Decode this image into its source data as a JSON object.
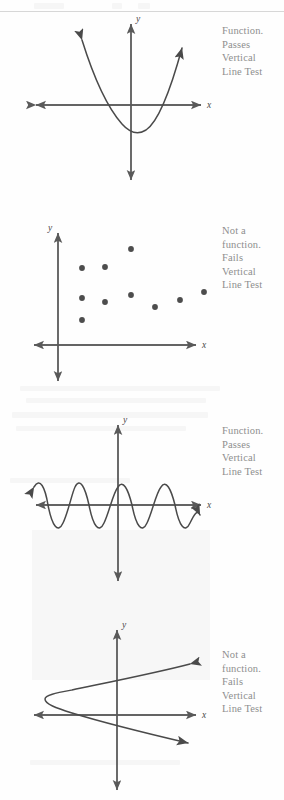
{
  "page": {
    "width": 284,
    "height": 800,
    "background": "#fefefe",
    "ink_color": "#4a4a4a",
    "axis_color": "#5a5a5a",
    "caption_color": "#8e8e8e"
  },
  "captions": {
    "function_passes": "Function.\nPasses\nVertical\nLine Test",
    "not_a_function_fails": "Not a\nfunction.\nFails\nVertical\nLine Test"
  },
  "axis_labels": {
    "x": "x",
    "y": "y"
  },
  "panels": [
    {
      "id": "panel-parabola-up",
      "index": 1,
      "graph_name": "upward-parabola",
      "caption": "Function.\nPasses\nVertical\nLine Test",
      "verdict": "Function. Passes Vertical Line Test",
      "x_axis_y": 105,
      "y_axis_x": 131,
      "caption_x": 222,
      "caption_y": 24
    },
    {
      "id": "panel-scatter",
      "index": 2,
      "graph_name": "scatter-points",
      "caption": "Not a\nfunction.\nFails\nVertical\nLine Test",
      "verdict": "Not a function. Fails Vertical Line Test",
      "x_axis_y": 345,
      "y_axis_x": 58,
      "caption_x": 222,
      "caption_y": 224
    },
    {
      "id": "panel-sine",
      "index": 3,
      "graph_name": "sine-wave",
      "caption": "Function.\nPasses\nVertical\nLine Test",
      "verdict": "Function. Passes Vertical Line Test",
      "x_axis_y": 505,
      "y_axis_x": 118,
      "caption_x": 222,
      "caption_y": 424
    },
    {
      "id": "panel-parabola-right",
      "index": 4,
      "graph_name": "rightward-parabola",
      "caption": "Not a\nfunction.\nFails\nVertical\nLine Test",
      "verdict": "Not a function. Fails Vertical Line Test",
      "x_axis_y": 715,
      "y_axis_x": 117,
      "caption_x": 222,
      "caption_y": 648
    }
  ],
  "chart_data": [
    {
      "type": "line",
      "id": "upward-parabola",
      "title": "Function. Passes Vertical Line Test",
      "xlabel": "x",
      "ylabel": "y",
      "grid": false,
      "legend": "none",
      "curve": "parabola opening upward, vertex below x-axis left of origin, both branches end in arrowheads",
      "vertex": [
        -5,
        -42
      ],
      "x_axis": {
        "from": [
          30,
          105
        ],
        "to": [
          207,
          105
        ],
        "arrows": "both"
      },
      "y_axis": {
        "from": [
          131,
          18
        ],
        "to": [
          131,
          185
        ],
        "arrows": "both"
      },
      "points": [
        [
          79,
          37
        ],
        [
          88,
          55
        ],
        [
          98,
          75
        ],
        [
          110,
          94
        ],
        [
          118,
          104
        ],
        [
          126,
          114
        ],
        [
          134,
          124
        ],
        [
          142,
          131
        ],
        [
          150,
          126
        ],
        [
          158,
          113
        ],
        [
          166,
          95
        ],
        [
          175,
          70
        ],
        [
          184,
          44
        ],
        [
          190,
          35
        ]
      ]
    },
    {
      "type": "scatter",
      "id": "scatter-points",
      "title": "Not a function. Fails Vertical Line Test",
      "xlabel": "x",
      "ylabel": "y",
      "grid": false,
      "legend": "none",
      "note": "Two points share the same x value, so a vertical line meets the graph twice",
      "x_axis": {
        "from": [
          28,
          345
        ],
        "to": [
          200,
          345
        ],
        "arrows": "both"
      },
      "y_axis": {
        "from": [
          58,
          228
        ],
        "to": [
          58,
          382
        ],
        "arrows": "both"
      },
      "x": [
        82,
        82,
        82,
        105,
        105,
        131,
        131,
        155,
        180,
        204
      ],
      "y": [
        298,
        268,
        320,
        267,
        302,
        249,
        295,
        307,
        300,
        292
      ],
      "values": [
        {
          "x": 82,
          "y": 298
        },
        {
          "x": 82,
          "y": 268
        },
        {
          "x": 82,
          "y": 320
        },
        {
          "x": 105,
          "y": 267
        },
        {
          "x": 105,
          "y": 302
        },
        {
          "x": 131,
          "y": 249
        },
        {
          "x": 131,
          "y": 295
        },
        {
          "x": 155,
          "y": 307
        },
        {
          "x": 180,
          "y": 300
        },
        {
          "x": 204,
          "y": 292
        }
      ]
    },
    {
      "type": "line",
      "id": "sine-wave",
      "title": "Function. Passes Vertical Line Test",
      "xlabel": "x",
      "ylabel": "y",
      "grid": false,
      "legend": "none",
      "curve": "sinusoid, approximately three full cycles, amplitude ~18 px, period ~58 px",
      "amplitude": 18,
      "period": 58,
      "cycles": 3,
      "x_axis": {
        "from": [
          30,
          505
        ],
        "to": [
          207,
          505
        ],
        "arrows": "both"
      },
      "y_axis": {
        "from": [
          118,
          420
        ],
        "to": [
          118,
          580
        ],
        "arrows": "both"
      }
    },
    {
      "type": "line",
      "id": "rightward-parabola",
      "title": "Not a function. Fails Vertical Line Test",
      "xlabel": "x",
      "ylabel": "y",
      "grid": false,
      "legend": "none",
      "curve": "parabola opening to the right, vertex left of the y-axis, both branches end in arrowheads",
      "vertex": [
        45,
        697
      ],
      "x_axis": {
        "from": [
          28,
          715
        ],
        "to": [
          200,
          715
        ],
        "arrows": "both"
      },
      "y_axis": {
        "from": [
          117,
          628
        ],
        "to": [
          117,
          790
        ],
        "arrows": "both"
      }
    }
  ],
  "artifacts": {
    "scan_rule_y": 11,
    "tint_block": {
      "x": 32,
      "y": 530,
      "width": 178,
      "height": 150,
      "color": "#9a9a9a"
    }
  }
}
